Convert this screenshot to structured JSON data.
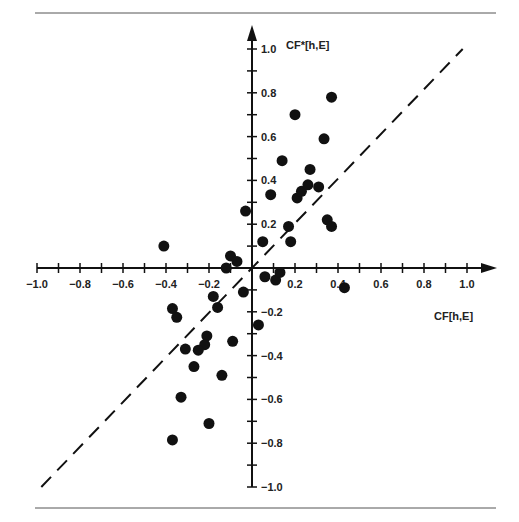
{
  "chart_data": {
    "type": "scatter",
    "title": "",
    "xlabel": "CF[h,E]",
    "ylabel": "CF*[h,E]",
    "xlim": [
      -1.0,
      1.0
    ],
    "ylim": [
      -1.0,
      1.0
    ],
    "grid": false,
    "x_ticks": [
      -1.0,
      -0.8,
      -0.6,
      -0.4,
      -0.2,
      0.2,
      0.4,
      0.6,
      0.8,
      1.0
    ],
    "x_tick_labels": [
      "−1.0",
      "−0.8",
      "−0.6",
      "−0.4",
      "−0.2",
      "0.2",
      "0.4",
      "0.6",
      "0.8",
      "1.0"
    ],
    "y_ticks": [
      1.0,
      0.8,
      0.6,
      0.4,
      0.2,
      -0.2,
      -0.4,
      -0.6,
      -0.8,
      -1.0
    ],
    "y_tick_labels": [
      "1.0",
      "0.8",
      "0.6",
      "0.4",
      "0.2",
      "−0.2",
      "−0.4",
      "−0.6",
      "−0.8",
      "−1.0"
    ],
    "reference_line": {
      "style": "dashed",
      "from": [
        -0.98,
        -1.0
      ],
      "to": [
        0.98,
        1.0
      ],
      "label": "y = x"
    },
    "series": [
      {
        "name": "observations",
        "points": [
          [
            0.2,
            0.7
          ],
          [
            0.37,
            0.78
          ],
          [
            0.335,
            0.59
          ],
          [
            0.14,
            0.49
          ],
          [
            0.27,
            0.45
          ],
          [
            0.087,
            0.335
          ],
          [
            0.21,
            0.32
          ],
          [
            0.23,
            0.35
          ],
          [
            0.26,
            0.38
          ],
          [
            0.31,
            0.37
          ],
          [
            0.35,
            0.22
          ],
          [
            0.37,
            0.19
          ],
          [
            0.17,
            0.19
          ],
          [
            0.05,
            0.12
          ],
          [
            0.18,
            0.12
          ],
          [
            -0.41,
            0.1
          ],
          [
            -0.03,
            0.26
          ],
          [
            -0.1,
            0.055
          ],
          [
            -0.07,
            0.03
          ],
          [
            -0.12,
            0.0
          ],
          [
            0.06,
            -0.04
          ],
          [
            0.11,
            -0.055
          ],
          [
            0.13,
            -0.02
          ],
          [
            0.43,
            -0.09
          ],
          [
            -0.37,
            -0.185
          ],
          [
            -0.35,
            -0.225
          ],
          [
            -0.18,
            -0.13
          ],
          [
            -0.16,
            -0.18
          ],
          [
            -0.04,
            -0.11
          ],
          [
            0.03,
            -0.26
          ],
          [
            -0.21,
            -0.31
          ],
          [
            -0.22,
            -0.35
          ],
          [
            -0.25,
            -0.375
          ],
          [
            -0.31,
            -0.37
          ],
          [
            -0.09,
            -0.335
          ],
          [
            -0.27,
            -0.45
          ],
          [
            -0.14,
            -0.49
          ],
          [
            -0.33,
            -0.59
          ],
          [
            -0.2,
            -0.71
          ],
          [
            -0.37,
            -0.785
          ]
        ]
      }
    ]
  },
  "colors": {
    "ink": "#111111",
    "rule": "#555555",
    "background": "#ffffff"
  }
}
